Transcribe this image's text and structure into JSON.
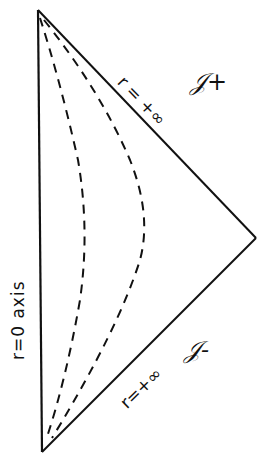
{
  "diagram": {
    "type": "Penrose conformal diagram",
    "vertices": {
      "top": [
        38,
        10
      ],
      "right": [
        256,
        238
      ],
      "bottom": [
        42,
        452
      ]
    },
    "labels": {
      "left_edge": "r=0   axis",
      "upper_edge": "r = +∞",
      "lower_edge": "r=+∞",
      "scri_plus": "𝒥+",
      "scri_minus": "𝒥-"
    },
    "curves": [
      {
        "name": "inner-dashed-curve",
        "style": "dashed",
        "apex_x": 85
      },
      {
        "name": "outer-dashed-curve",
        "style": "dashed",
        "apex_x": 145
      }
    ],
    "colors": {
      "ink": "#111111",
      "paper": "#ffffff"
    }
  }
}
